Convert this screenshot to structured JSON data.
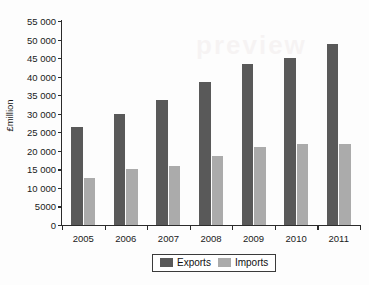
{
  "chart_data": {
    "type": "bar",
    "title": "",
    "subtitle": "",
    "xlabel": "",
    "ylabel": "£million",
    "categories": [
      "2005",
      "2006",
      "2007",
      "2008",
      "2009",
      "2010",
      "2011"
    ],
    "series": [
      {
        "name": "Exports",
        "color": "#595959",
        "values": [
          26400,
          29800,
          33800,
          38500,
          43300,
          45000,
          48700
        ]
      },
      {
        "name": "Imports",
        "color": "#ababab",
        "values": [
          12700,
          15100,
          16000,
          18700,
          21000,
          21800,
          21900
        ]
      }
    ],
    "ylim": [
      0,
      55000
    ],
    "ytick_values": [
      0,
      5000,
      10000,
      15000,
      20000,
      25000,
      30000,
      35000,
      40000,
      45000,
      50000,
      55000
    ],
    "ytick_labels": [
      "0",
      "5000",
      "10 000",
      "15 000",
      "20 000",
      "25 000",
      "30 000",
      "35 000",
      "40 000",
      "45 000",
      "50 000",
      "55 000"
    ],
    "grid": false,
    "legend_position": "bottom",
    "legend_entries": [
      "Exports",
      "Imports"
    ]
  },
  "watermark": {
    "text": "preview"
  },
  "colors": {
    "exports": "#595959",
    "imports": "#ababab",
    "axis": "#2b2b2b",
    "background": "#fdfdfd"
  }
}
